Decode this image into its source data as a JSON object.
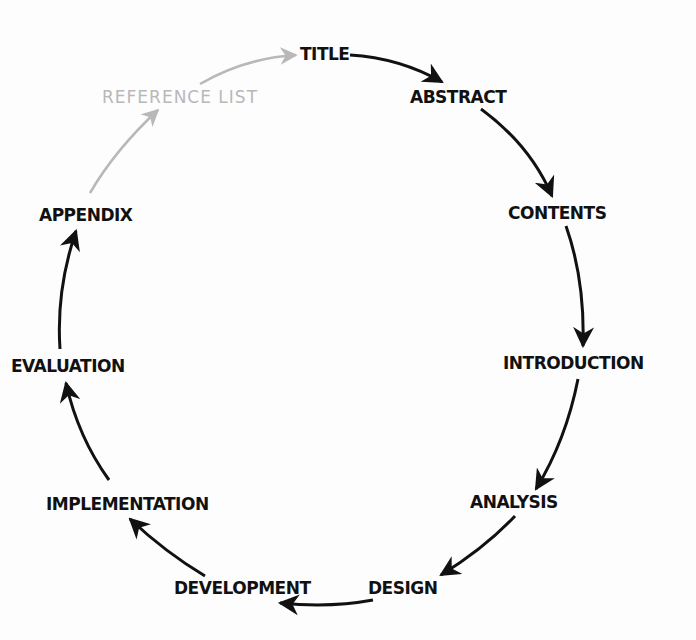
{
  "diagram": {
    "type": "cycle",
    "colors": {
      "arrow": "#111111",
      "faded_arrow": "#b8b8b8",
      "text": "#111111",
      "faded_text": "#b8b8b8"
    },
    "nodes": [
      {
        "id": "title",
        "label": "TITLE"
      },
      {
        "id": "abstract",
        "label": "ABSTRACT"
      },
      {
        "id": "contents",
        "label": "CONTENTS"
      },
      {
        "id": "introduction",
        "label": "INTRODUCTION"
      },
      {
        "id": "analysis",
        "label": "ANALYSIS"
      },
      {
        "id": "design",
        "label": "DESIGN"
      },
      {
        "id": "development",
        "label": "DEVELOPMENT"
      },
      {
        "id": "implementation",
        "label": "IMPLEMENTATION"
      },
      {
        "id": "evaluation",
        "label": "EVALUATION"
      },
      {
        "id": "appendix",
        "label": "APPENDIX"
      },
      {
        "id": "reference_list",
        "label": "REFERENCE LIST",
        "faded": true
      }
    ],
    "edges": [
      {
        "from": "title",
        "to": "abstract"
      },
      {
        "from": "abstract",
        "to": "contents"
      },
      {
        "from": "contents",
        "to": "introduction"
      },
      {
        "from": "introduction",
        "to": "analysis"
      },
      {
        "from": "analysis",
        "to": "design"
      },
      {
        "from": "design",
        "to": "development"
      },
      {
        "from": "development",
        "to": "implementation"
      },
      {
        "from": "implementation",
        "to": "evaluation"
      },
      {
        "from": "evaluation",
        "to": "appendix"
      },
      {
        "from": "appendix",
        "to": "reference_list",
        "faded": true
      },
      {
        "from": "reference_list",
        "to": "title",
        "faded": true
      }
    ]
  }
}
